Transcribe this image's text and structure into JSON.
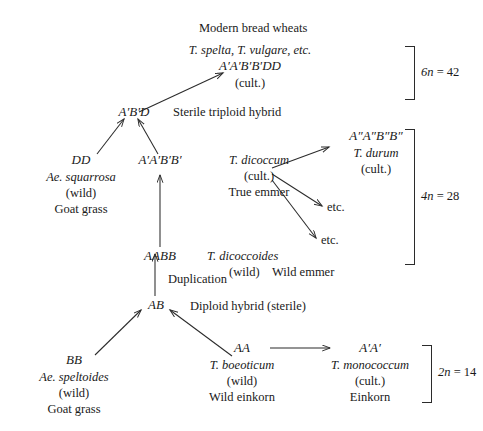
{
  "diagram": {
    "title_text": "Modern bread wheats",
    "nodes": {
      "hexaploid": {
        "species": "T. spelta, T. vulgare, etc.",
        "genome": "A′A′B′B′DD",
        "status": "(cult.)"
      },
      "triploid_hybrid": {
        "genome": "A′B′D",
        "note": "Sterile triploid hybrid"
      },
      "squarrosa": {
        "genome": "DD",
        "species": "Ae. squarrosa",
        "status": "(wild)",
        "common": "Goat grass"
      },
      "tetraploid_primed": {
        "genome": "A′A′B′B′"
      },
      "dicoccum": {
        "species": "T. dicoccum",
        "status": "(cult.)",
        "common": "True emmer"
      },
      "durum": {
        "genome": "A″A″B″B″",
        "species": "T. durum",
        "status": "(cult.)"
      },
      "etc_upper": {
        "label": "etc."
      },
      "etc_lower": {
        "label": "etc."
      },
      "aabb": {
        "genome": "AABB"
      },
      "dicoccoides": {
        "species": "T. dicoccoides",
        "status": "(wild)",
        "common": "Wild emmer"
      },
      "duplication": {
        "label": "Duplication"
      },
      "ab": {
        "genome": "AB",
        "note": "Diploid hybrid (sterile)"
      },
      "speltoides": {
        "genome": "BB",
        "species": "Ae. speltoides",
        "status": "(wild)",
        "common": "Goat grass"
      },
      "boeoticum": {
        "genome": "AA",
        "species": "T. boeoticum",
        "status": "(wild)",
        "common": "Wild einkorn"
      },
      "monococcum": {
        "genome": "A′A′",
        "species": "T. monococcum",
        "status": "(cult.)",
        "common": "Einkorn"
      }
    },
    "ploidy_brackets": [
      {
        "id": "hexaploid",
        "prefix": "6",
        "n": "n",
        "equals": " = 42"
      },
      {
        "id": "tetraploid",
        "prefix": "4",
        "n": "n",
        "equals": " = 28"
      },
      {
        "id": "diploid",
        "prefix": "2",
        "n": "n",
        "equals": " = 14"
      }
    ],
    "colors": {
      "ink": "#1a1a1a",
      "line": "#2b2b2b",
      "background": "#ffffff"
    }
  }
}
